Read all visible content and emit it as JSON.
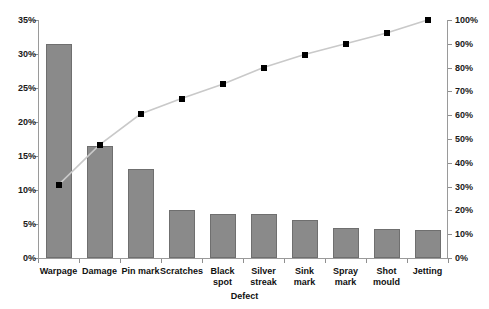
{
  "title_sliver": "",
  "chart_data": {
    "type": "bar",
    "title": "",
    "xlabel": "Defect",
    "ylabel": "",
    "categories": [
      "Warpage",
      "Damage",
      "Pin mark",
      "Scratches",
      "Black spot",
      "Silver streak",
      "Sink mark",
      "Spray mark",
      "Shot mould",
      "Jetting"
    ],
    "values": [
      31.5,
      16.4,
      13.1,
      7.0,
      6.5,
      6.5,
      5.6,
      4.4,
      4.2,
      4.1
    ],
    "ylim": [
      0,
      35
    ],
    "ylim_right": [
      0,
      100
    ],
    "grid": false,
    "legend": "none",
    "series": [
      {
        "name": "Defect percentage",
        "type": "bar",
        "axis": "left",
        "values": [
          31.5,
          16.4,
          13.1,
          7.0,
          6.5,
          6.5,
          5.6,
          4.4,
          4.2,
          4.1
        ]
      },
      {
        "name": "Cumulative percentage",
        "type": "line",
        "axis": "right",
        "values": [
          30.7,
          47.5,
          60.5,
          67.0,
          73.0,
          80.0,
          85.5,
          90.0,
          94.5,
          100.0
        ]
      }
    ],
    "left_axis_ticks": [
      "0%",
      "5%",
      "10%",
      "15%",
      "20%",
      "25%",
      "30%",
      "35%"
    ],
    "right_axis_ticks": [
      "0%",
      "10%",
      "20%",
      "30%",
      "40%",
      "50%",
      "60%",
      "70%",
      "80%",
      "90%",
      "100%"
    ],
    "colors": {
      "bar_fill": "#8a8a8a",
      "bar_border": "#6f6f6f",
      "line": "#c9c9c9",
      "marker": "#000000",
      "axis": "#9a9a9a",
      "text": "#111111",
      "background": "#ffffff"
    }
  }
}
